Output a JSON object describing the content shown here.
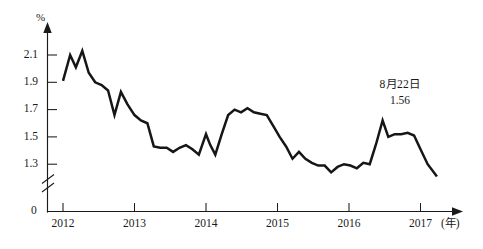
{
  "chart_data": {
    "type": "line",
    "title": "",
    "subtitle": "",
    "xlabel": "(年)",
    "ylabel": "%",
    "grid": false,
    "legend": "none",
    "axis_break": true,
    "axis_break_note": "y-axis broken between 0 and 1.3",
    "ylim": [
      1.2,
      2.2
    ],
    "yticks": [
      "2.1",
      "1.9",
      "1.7",
      "1.5",
      "1.3"
    ],
    "ytick_values": [
      2.1,
      1.9,
      1.7,
      1.5,
      1.3
    ],
    "y_origin_label": "0",
    "xlim": [
      2012.0,
      2017.23
    ],
    "xticks": [
      "2012",
      "2013",
      "2014",
      "2015",
      "2016",
      "2017"
    ],
    "xtick_values": [
      2012,
      2013,
      2014,
      2015,
      2016,
      2017
    ],
    "annotations": [
      {
        "date_label": "8月22日",
        "value_label": "1.56",
        "x": 2016.55,
        "y": 1.78
      }
    ],
    "series": [
      {
        "name": "rate",
        "color": "#161616",
        "x": [
          2012.0,
          2012.1,
          2012.18,
          2012.27,
          2012.36,
          2012.45,
          2012.54,
          2012.63,
          2012.72,
          2012.81,
          2012.9,
          2013.0,
          2013.09,
          2013.18,
          2013.27,
          2013.36,
          2013.45,
          2013.54,
          2013.63,
          2013.72,
          2013.81,
          2013.9,
          2014.0,
          2014.06,
          2014.13,
          2014.22,
          2014.31,
          2014.4,
          2014.49,
          2014.58,
          2014.67,
          2014.76,
          2014.85,
          2014.94,
          2015.03,
          2015.12,
          2015.21,
          2015.3,
          2015.39,
          2015.48,
          2015.57,
          2015.66,
          2015.75,
          2015.84,
          2015.93,
          2016.02,
          2016.11,
          2016.2,
          2016.29,
          2016.38,
          2016.47,
          2016.55,
          2016.64,
          2016.73,
          2016.82,
          2016.91,
          2017.0,
          2017.1,
          2017.23
        ],
        "y": [
          1.91,
          2.1,
          2.01,
          2.13,
          1.97,
          1.9,
          1.88,
          1.84,
          1.66,
          1.83,
          1.74,
          1.66,
          1.62,
          1.6,
          1.43,
          1.42,
          1.42,
          1.39,
          1.42,
          1.44,
          1.41,
          1.37,
          1.52,
          1.44,
          1.37,
          1.52,
          1.66,
          1.7,
          1.68,
          1.71,
          1.68,
          1.67,
          1.66,
          1.58,
          1.5,
          1.43,
          1.34,
          1.39,
          1.34,
          1.31,
          1.29,
          1.29,
          1.24,
          1.28,
          1.3,
          1.29,
          1.27,
          1.31,
          1.3,
          1.45,
          1.62,
          1.5,
          1.52,
          1.52,
          1.53,
          1.51,
          1.41,
          1.3,
          1.21
        ]
      }
    ]
  }
}
